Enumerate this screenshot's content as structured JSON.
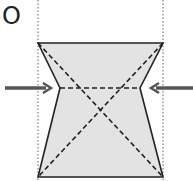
{
  "diagram": {
    "label": "O",
    "colors": {
      "fill": "#e3e3e3",
      "stroke": "#222222",
      "arrow": "#555555",
      "guide": "#888888"
    },
    "shape": {
      "type": "pinched-trapezoid",
      "vertices": {
        "top_left": [
          38,
          43
        ],
        "top_right": [
          163,
          43
        ],
        "waist_right": [
          140,
          88
        ],
        "bottom_right": [
          163,
          177
        ],
        "bottom_left": [
          38,
          177
        ],
        "waist_left": [
          60,
          88
        ]
      },
      "center": [
        99,
        88
      ]
    },
    "guides": [
      {
        "name": "left-dotted-guide",
        "x": 38
      },
      {
        "name": "right-dotted-guide",
        "x": 163
      }
    ],
    "arrows": [
      {
        "name": "left-arrow",
        "direction": "right",
        "from": [
          5,
          88
        ],
        "to": [
          52,
          88
        ]
      },
      {
        "name": "right-arrow",
        "direction": "left",
        "from": [
          193,
          88
        ],
        "to": [
          150,
          88
        ]
      }
    ]
  }
}
